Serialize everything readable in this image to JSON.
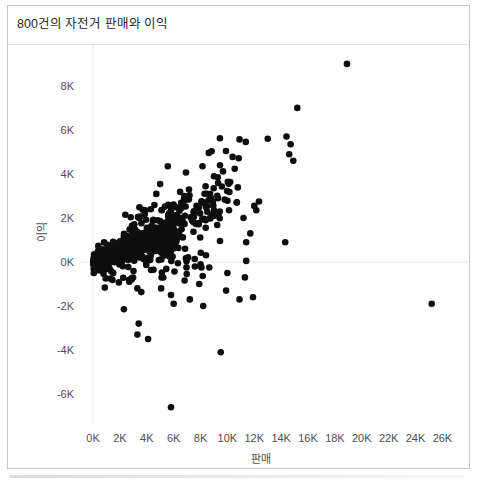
{
  "chart_data": {
    "type": "scatter",
    "title": "800건의 자전거 판매와 이익",
    "xlabel": "판매",
    "ylabel": "이익",
    "unit": "K",
    "legend": "none",
    "grid": "zero-lines-only",
    "x_range": [
      -0.97,
      28.2
    ],
    "y_range": [
      -7.36,
      9.86
    ],
    "x_tick_values": [
      0,
      2,
      4,
      6,
      8,
      10,
      12,
      14,
      16,
      18,
      20,
      22,
      24,
      26
    ],
    "x_tick_labels": [
      "0K",
      "2K",
      "4K",
      "6K",
      "8K",
      "10K",
      "12K",
      "14K",
      "16K",
      "18K",
      "20K",
      "22K",
      "24K",
      "26K"
    ],
    "y_tick_values": [
      8,
      6,
      4,
      2,
      0,
      -2,
      -4,
      -6
    ],
    "y_tick_labels": [
      "8K",
      "6K",
      "4K",
      "2K",
      "0K",
      "-2K",
      "-4K",
      "-6K"
    ],
    "point_color": "#0e0e0e",
    "zero_line_color": "#e8e8e8",
    "point_radius_px": 3.3,
    "points": [
      [
        18.9,
        9.0
      ],
      [
        15.2,
        7.0
      ],
      [
        13.0,
        5.6
      ],
      [
        14.4,
        5.7
      ],
      [
        14.7,
        5.35
      ],
      [
        14.6,
        4.9
      ],
      [
        14.9,
        4.6
      ],
      [
        12.35,
        2.75
      ],
      [
        12.15,
        2.35
      ],
      [
        12.0,
        2.55
      ],
      [
        11.2,
        2.0
      ],
      [
        11.7,
        1.3
      ],
      [
        11.4,
        0.9
      ],
      [
        14.3,
        0.9
      ],
      [
        11.9,
        -1.6
      ],
      [
        25.2,
        -1.9
      ],
      [
        9.0,
        3.9
      ],
      [
        10.7,
        2.7
      ],
      [
        9.3,
        2.9
      ],
      [
        8.3,
        3.1
      ],
      [
        6.8,
        3.0
      ],
      [
        8.4,
        2.5
      ],
      [
        7.5,
        2.3
      ],
      [
        4.3,
        2.4
      ],
      [
        3.9,
        2.35
      ],
      [
        2.4,
        2.15
      ],
      [
        5.6,
        2.6
      ],
      [
        2.3,
        -2.15
      ],
      [
        3.4,
        -2.8
      ],
      [
        3.3,
        -3.3
      ],
      [
        4.1,
        -3.5
      ],
      [
        9.5,
        -4.1
      ],
      [
        5.8,
        -6.6
      ],
      [
        6.0,
        -1.9
      ],
      [
        8.2,
        -2.0
      ],
      [
        1.5,
        -0.5
      ],
      [
        2.7,
        -0.9
      ],
      [
        3.3,
        -1.2
      ],
      [
        4.5,
        -0.35
      ],
      [
        5.1,
        -0.7
      ],
      [
        5.8,
        -1.5
      ],
      [
        7.2,
        -1.7
      ],
      [
        7.9,
        -1.0
      ],
      [
        10.0,
        -0.5
      ],
      [
        11.3,
        -0.7
      ],
      [
        9.9,
        -1.3
      ],
      [
        10.9,
        -1.7
      ],
      [
        11.4,
        0.05
      ],
      [
        8.0,
        -0.1
      ]
    ],
    "dense_clusters": [
      {
        "n": 420,
        "x_min": 0.05,
        "x_max": 6.5,
        "x_pow": 1.7,
        "slope": 0.2,
        "intercept": -0.02,
        "noise": 0.42,
        "fan": 0.35
      },
      {
        "n": 170,
        "x_min": 0.3,
        "x_max": 9.5,
        "x_pow": 1.35,
        "slope": 0.26,
        "intercept": 0.05,
        "noise": 0.6,
        "fan": 0.45
      },
      {
        "n": 80,
        "x_min": 1.5,
        "x_max": 11.0,
        "x_pow": 1.2,
        "slope": 0.3,
        "intercept": 0.3,
        "noise": 0.8,
        "fan": 0.5
      },
      {
        "n": 45,
        "x_min": 0.8,
        "x_max": 9.5,
        "x_pow": 1.1,
        "slope": 0.12,
        "intercept": -0.75,
        "noise": 0.55,
        "fan": 0.6
      },
      {
        "n": 25,
        "x_min": 3.0,
        "x_max": 11.5,
        "x_pow": 1.0,
        "slope": 0.32,
        "intercept": 0.8,
        "noise": 0.95,
        "fan": 0.6
      }
    ],
    "seed": 20240913
  }
}
